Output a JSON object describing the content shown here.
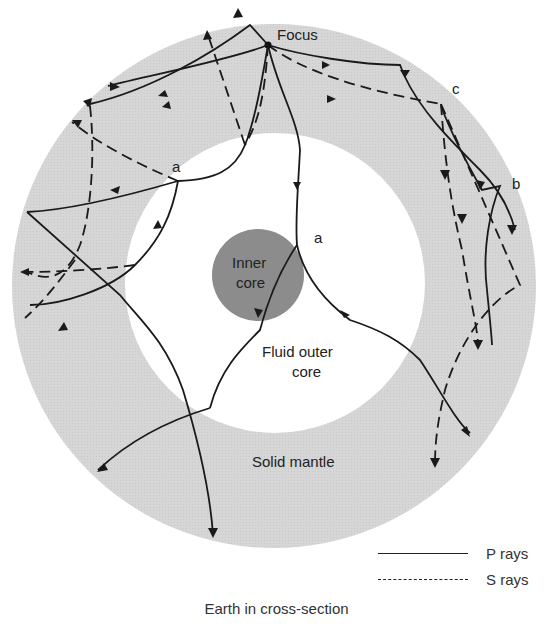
{
  "figure": {
    "title": "Earth in cross-section",
    "labels": {
      "focus": "Focus",
      "inner_core": [
        "Inner",
        "core"
      ],
      "outer_core": [
        "Fluid outer",
        "core"
      ],
      "mantle": "Solid mantle",
      "point_a_left": "a",
      "point_a_center": "a",
      "point_b": "b",
      "point_c": "c"
    },
    "layers": [
      {
        "name": "Solid mantle",
        "color": "#d4d4d4"
      },
      {
        "name": "Fluid outer core",
        "color": "#ffffff"
      },
      {
        "name": "Inner core",
        "color": "#8a8a8a"
      }
    ]
  },
  "legend": {
    "items": [
      {
        "style": "solid",
        "label": "P rays"
      },
      {
        "style": "dashed",
        "label": "S rays"
      }
    ]
  },
  "caption": "Earth in cross-section"
}
